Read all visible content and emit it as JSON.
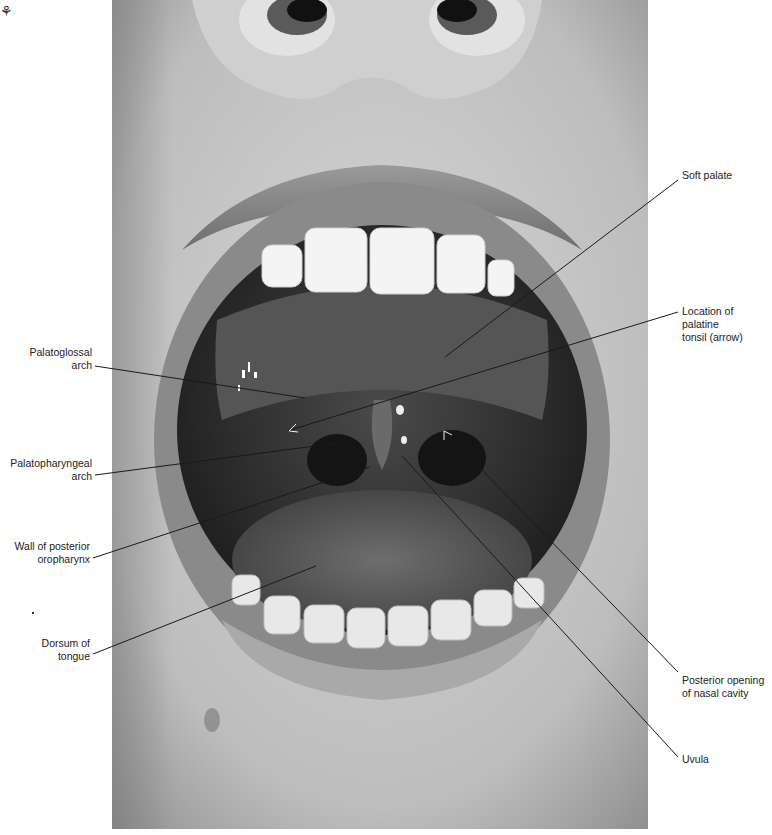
{
  "figure": {
    "corner_mark": "⚘"
  },
  "labels": {
    "soft_palate": "Soft palate",
    "palatine_tonsil_line1": "Location of palatine",
    "palatine_tonsil_line2": "tonsil (arrow)",
    "palatoglossal_line1": "Palatoglossal",
    "palatoglossal_line2": "arch",
    "palatopharyngeal_line1": "Palatopharyngeal",
    "palatopharyngeal_line2": "arch",
    "posterior_wall_line1": "Wall of posterior",
    "posterior_wall_line2": "oropharynx",
    "dorsum_line1": "Dorsum of",
    "dorsum_line2": "tongue",
    "nasal_opening_line1": "Posterior opening",
    "nasal_opening_line2": "of nasal cavity",
    "uvula": "Uvula"
  },
  "colors": {
    "background": "#ffffff",
    "leader_line": "#1a1a1a",
    "label_text": "#222222"
  }
}
